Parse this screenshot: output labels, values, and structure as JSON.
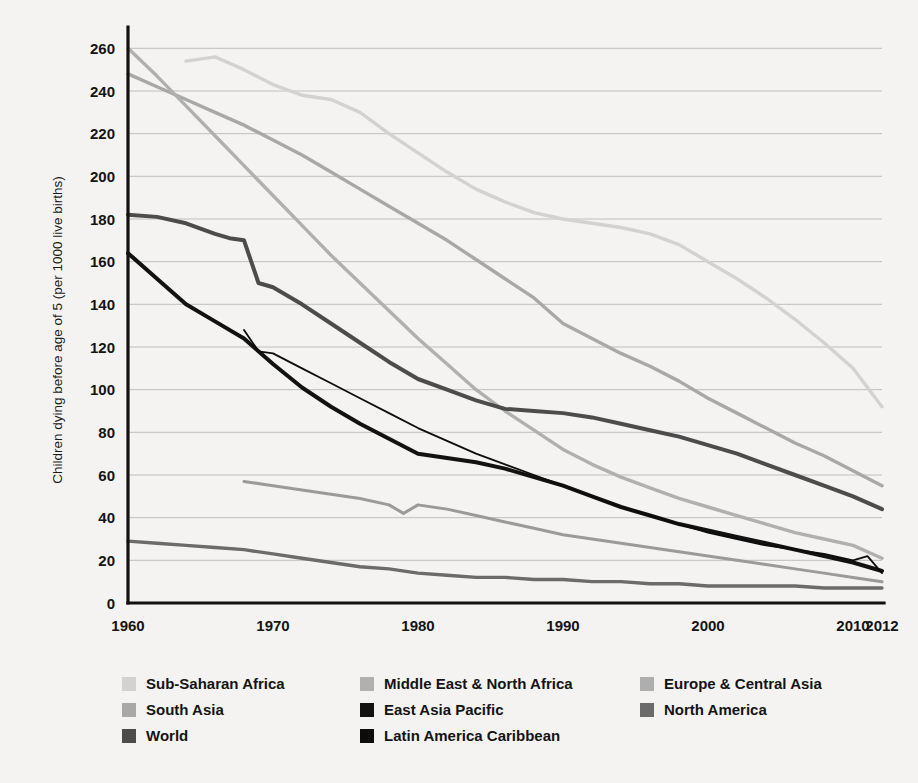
{
  "chart_data": {
    "type": "line",
    "title": "",
    "xlabel": "",
    "ylabel": "Children dying before age of 5 (per 1000 live births)",
    "xlim": [
      1960,
      2012
    ],
    "ylim": [
      0,
      270
    ],
    "grid": true,
    "legend_position": "bottom",
    "x_ticks": [
      "1960",
      "1970",
      "1980",
      "1990",
      "2000",
      "2010",
      "2012"
    ],
    "x_tick_values": [
      1960,
      1970,
      1980,
      1990,
      2000,
      2010,
      2012
    ],
    "y_ticks": [
      "0",
      "20",
      "40",
      "60",
      "80",
      "100",
      "120",
      "140",
      "160",
      "180",
      "200",
      "220",
      "240",
      "260"
    ],
    "y_tick_values": [
      0,
      20,
      40,
      60,
      80,
      100,
      120,
      140,
      160,
      180,
      200,
      220,
      240,
      260
    ],
    "series": [
      {
        "name": "Sub-Saharan Africa",
        "color": "#d2d2d2",
        "width": 3.4,
        "x": [
          1964,
          1966,
          1968,
          1970,
          1972,
          1974,
          1976,
          1978,
          1980,
          1982,
          1984,
          1986,
          1988,
          1990,
          1992,
          1994,
          1996,
          1998,
          2000,
          2002,
          2004,
          2006,
          2008,
          2010,
          2012
        ],
        "values": [
          254,
          256,
          250,
          243,
          238,
          236,
          230,
          220,
          211,
          202,
          194,
          188,
          183,
          180,
          178,
          176,
          173,
          168,
          160,
          152,
          143,
          133,
          122,
          110,
          92
        ]
      },
      {
        "name": "South Asia",
        "color": "#a8a8a8",
        "width": 3.4,
        "x": [
          1960,
          1962,
          1964,
          1966,
          1968,
          1970,
          1972,
          1974,
          1976,
          1978,
          1980,
          1982,
          1984,
          1986,
          1988,
          1990,
          1992,
          1994,
          1996,
          1998,
          2000,
          2002,
          2004,
          2006,
          2008,
          2010,
          2012
        ],
        "values": [
          248,
          242,
          236,
          230,
          224,
          217,
          210,
          202,
          194,
          186,
          178,
          170,
          161,
          152,
          143,
          131,
          124,
          117,
          111,
          104,
          96,
          89,
          82,
          75,
          69,
          62,
          55
        ]
      },
      {
        "name": "Middle East & North Africa",
        "color": "#b0b0b0",
        "width": 3.4,
        "x": [
          1960,
          1962,
          1964,
          1966,
          1968,
          1970,
          1972,
          1974,
          1976,
          1978,
          1980,
          1982,
          1984,
          1986,
          1988,
          1990,
          1992,
          1994,
          1996,
          1998,
          2000,
          2002,
          2004,
          2006,
          2008,
          2010,
          2012
        ],
        "values": [
          260,
          247,
          233,
          219,
          205,
          191,
          177,
          163,
          150,
          137,
          124,
          112,
          100,
          90,
          81,
          72,
          65,
          59,
          54,
          49,
          45,
          41,
          37,
          33,
          30,
          27,
          21
        ]
      },
      {
        "name": "Europe & Central Asia",
        "color": "#9a9a9a",
        "width": 3.0,
        "x": [
          1968,
          1970,
          1972,
          1974,
          1976,
          1978,
          1979,
          1980,
          1982,
          1984,
          1986,
          1988,
          1990,
          1992,
          1994,
          1996,
          1998,
          2000,
          2002,
          2004,
          2006,
          2008,
          2010,
          2012
        ],
        "values": [
          57,
          55,
          53,
          51,
          49,
          46,
          42,
          46,
          44,
          41,
          38,
          35,
          32,
          30,
          28,
          26,
          24,
          22,
          20,
          18,
          16,
          14,
          12,
          10
        ]
      },
      {
        "name": "World",
        "color": "#4c4c4c",
        "width": 4.0,
        "x": [
          1960,
          1962,
          1964,
          1966,
          1967,
          1968,
          1969,
          1970,
          1972,
          1974,
          1976,
          1978,
          1980,
          1982,
          1984,
          1986,
          1988,
          1990,
          1992,
          1994,
          1996,
          1998,
          2000,
          2002,
          2004,
          2006,
          2008,
          2010,
          2012
        ],
        "values": [
          182,
          181,
          178,
          173,
          171,
          170,
          150,
          148,
          140,
          131,
          122,
          113,
          105,
          100,
          95,
          91,
          90,
          89,
          87,
          84,
          81,
          78,
          74,
          70,
          65,
          60,
          55,
          50,
          44
        ]
      },
      {
        "name": "East Asia Pacific",
        "color": "#121212",
        "width": 4.0,
        "x": [
          1960,
          1962,
          1964,
          1966,
          1968,
          1970,
          1972,
          1974,
          1976,
          1978,
          1980,
          1982,
          1984,
          1986,
          1988,
          1990,
          1992,
          1994,
          1996,
          1998,
          2000,
          2002,
          2004,
          2006,
          2008,
          2010,
          2012
        ],
        "values": [
          164,
          152,
          140,
          132,
          124,
          112,
          101,
          92,
          84,
          77,
          70,
          68,
          66,
          63,
          59,
          55,
          50,
          45,
          41,
          37,
          34,
          31,
          28,
          25,
          22,
          19,
          15
        ]
      },
      {
        "name": "Latin America Caribbean",
        "color": "#0d0d0d",
        "width": 1.8,
        "x": [
          1968,
          1969,
          1970,
          1972,
          1974,
          1976,
          1978,
          1980,
          1982,
          1984,
          1986,
          1988,
          1990,
          1992,
          1994,
          1996,
          1998,
          2000,
          2002,
          2004,
          2006,
          2008,
          2010,
          2011,
          2012
        ],
        "values": [
          128,
          118,
          117,
          110,
          103,
          96,
          89,
          82,
          76,
          70,
          65,
          60,
          55,
          50,
          45,
          41,
          37,
          33,
          30,
          27,
          25,
          23,
          20,
          22,
          14
        ]
      },
      {
        "name": "North America",
        "color": "#6b6b6b",
        "width": 3.4,
        "x": [
          1960,
          1962,
          1964,
          1966,
          1968,
          1970,
          1972,
          1974,
          1976,
          1978,
          1980,
          1982,
          1984,
          1986,
          1988,
          1990,
          1992,
          1994,
          1996,
          1998,
          2000,
          2002,
          2004,
          2006,
          2008,
          2010,
          2012
        ],
        "values": [
          29,
          28,
          27,
          26,
          25,
          23,
          21,
          19,
          17,
          16,
          14,
          13,
          12,
          12,
          11,
          11,
          10,
          10,
          9,
          9,
          8,
          8,
          8,
          8,
          7,
          7,
          7
        ]
      }
    ]
  },
  "legend": {
    "columns": [
      [
        {
          "label": "Sub-Saharan Africa",
          "color": "#d2d2d2"
        },
        {
          "label": "South Asia",
          "color": "#a8a8a8"
        },
        {
          "label": "World",
          "color": "#4c4c4c"
        }
      ],
      [
        {
          "label": "Middle East & North Africa",
          "color": "#b0b0b0"
        },
        {
          "label": "East Asia Pacific",
          "color": "#121212"
        },
        {
          "label": "Latin America Caribbean",
          "color": "#0d0d0d"
        }
      ],
      [
        {
          "label": "Europe & Central Asia",
          "color": "#aeaeae"
        },
        {
          "label": "North America",
          "color": "#6b6b6b"
        }
      ]
    ]
  },
  "theme": {
    "background": "#f4f3f1",
    "axis_color": "#111111",
    "grid_color": "#b9b9b9",
    "text_color": "#141414"
  }
}
